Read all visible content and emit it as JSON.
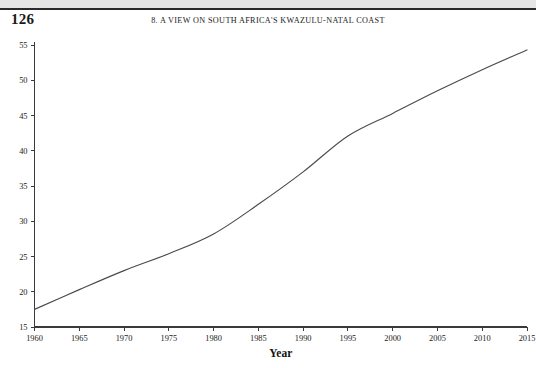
{
  "page": {
    "number": "126",
    "running_head": "8. A VIEW ON SOUTH AFRICA'S KWAZULU-NATAL COAST",
    "background_color": "#ffffff",
    "scan_band_color": "#e6e6e6",
    "rule_color": "#2b2b2b"
  },
  "chart_data": {
    "type": "line",
    "title": "",
    "subtitle": "",
    "xlabel": "Year",
    "ylabel": "",
    "xlim": [
      1960,
      2015
    ],
    "ylim": [
      15,
      55
    ],
    "grid": false,
    "legend": false,
    "legend_position": "none",
    "line_color": "#4a4a4a",
    "xticks": [
      1960,
      1965,
      1970,
      1975,
      1980,
      1985,
      1990,
      1995,
      2000,
      2005,
      2010,
      2015
    ],
    "xtick_labels": [
      "1960",
      "1965",
      "1970",
      "1975",
      "1980",
      "1985",
      "1990",
      "1995",
      "2000",
      "2005",
      "2010",
      "2015"
    ],
    "yticks": [
      15,
      20,
      25,
      30,
      35,
      40,
      45,
      50,
      55
    ],
    "ytick_labels": [
      "15",
      "20",
      "25",
      "30",
      "35",
      "40",
      "45",
      "50",
      "55"
    ],
    "x": [
      1960,
      1965,
      1970,
      1975,
      1980,
      1985,
      1990,
      1995,
      2000,
      2005,
      2010,
      2015
    ],
    "values": [
      17.5,
      20.3,
      23.0,
      25.4,
      28.2,
      32.4,
      37.0,
      42.1,
      45.3,
      48.5,
      51.5,
      54.3
    ],
    "series": [
      {
        "name": "",
        "x": [
          1960,
          1965,
          1970,
          1975,
          1980,
          1985,
          1990,
          1995,
          2000,
          2005,
          2010,
          2015
        ],
        "values": [
          17.5,
          20.3,
          23.0,
          25.4,
          28.2,
          32.4,
          37.0,
          42.1,
          45.3,
          48.5,
          51.5,
          54.3
        ]
      }
    ],
    "annotations": []
  }
}
